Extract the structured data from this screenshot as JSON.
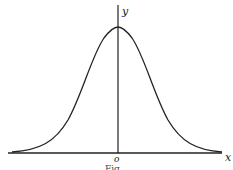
{
  "figure": {
    "type": "bell curve (normal distribution) sketch",
    "axes": {
      "x_label": "x",
      "y_label": "y",
      "origin_label": "o"
    },
    "caption": "Fig. ",
    "colors": {
      "ink": "#222222",
      "background": "#ffffff"
    }
  }
}
